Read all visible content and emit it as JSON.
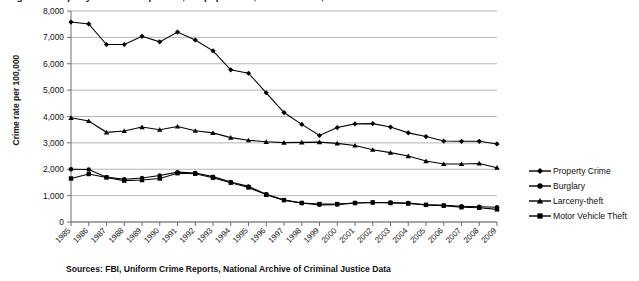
{
  "title": "Figure 1. Property crime rates per 100,000 population, United States, 1985-2009",
  "source_caption": "Sources: FBI, Uniform Crime Reports, National Archive of Criminal Justice Data",
  "legend": {
    "items": [
      {
        "label": "Property Crime",
        "marker": "diamond-marker",
        "color": "#000000"
      },
      {
        "label": "Burglary",
        "marker": "circle-marker",
        "color": "#000000"
      },
      {
        "label": "Larceny-theft",
        "marker": "triangle-marker",
        "color": "#000000"
      },
      {
        "label": "Motor Vehicle Theft",
        "marker": "square-marker",
        "color": "#000000"
      }
    ]
  },
  "colors": {
    "line": "#000000",
    "gridline": "#b5b5b5",
    "axis": "#6e6e6e",
    "text": "#111111",
    "background": "#ffffff"
  },
  "chart_data": {
    "type": "line",
    "title": "Figure 1. Property crime rates per 100,000 population, United States, 1985-2009",
    "xlabel": "",
    "ylabel": "Crime rate per 100,000",
    "ylim": [
      0,
      8000
    ],
    "ytick_labels": [
      "8,000",
      "7,000",
      "6,000",
      "5,000",
      "4,000",
      "3,000",
      "2,000",
      "1,000",
      "0"
    ],
    "yticks": [
      8000,
      7000,
      6000,
      5000,
      4000,
      3000,
      2000,
      1000,
      0
    ],
    "grid": true,
    "legend_position": "right",
    "categories": [
      "1985",
      "1986",
      "1987",
      "1988",
      "1989",
      "1990",
      "1991",
      "1992",
      "1993",
      "1994",
      "1995",
      "1996",
      "1997",
      "1998",
      "1999",
      "2000",
      "2001",
      "2002",
      "2003",
      "2004",
      "2005",
      "2006",
      "2007",
      "2008",
      "2009"
    ],
    "series": [
      {
        "name": "Property Crime",
        "marker": "diamond",
        "values": [
          7580,
          7510,
          6730,
          6730,
          7040,
          6830,
          7200,
          6900,
          6490,
          5770,
          5640,
          4900,
          4150,
          3700,
          3280,
          3580,
          3720,
          3730,
          3600,
          3380,
          3240,
          3070,
          3060,
          3060,
          2960
        ]
      },
      {
        "name": "Burglary",
        "marker": "circle",
        "values": [
          2000,
          1990,
          1700,
          1620,
          1670,
          1760,
          1890,
          1860,
          1720,
          1520,
          1350,
          1050,
          830,
          720,
          650,
          660,
          720,
          740,
          740,
          720,
          650,
          630,
          600,
          580,
          560
        ]
      },
      {
        "name": "Larceny-theft",
        "marker": "triangle",
        "values": [
          3950,
          3830,
          3400,
          3450,
          3600,
          3500,
          3620,
          3460,
          3380,
          3200,
          3100,
          3040,
          3010,
          3020,
          3030,
          2980,
          2900,
          2740,
          2630,
          2500,
          2310,
          2200,
          2200,
          2220,
          2060
        ]
      },
      {
        "name": "Motor Vehicle Theft",
        "marker": "square",
        "values": [
          1650,
          1820,
          1690,
          1570,
          1590,
          1650,
          1850,
          1830,
          1680,
          1490,
          1310,
          1030,
          830,
          720,
          680,
          680,
          720,
          740,
          720,
          700,
          650,
          620,
          560,
          540,
          480
        ]
      }
    ]
  }
}
